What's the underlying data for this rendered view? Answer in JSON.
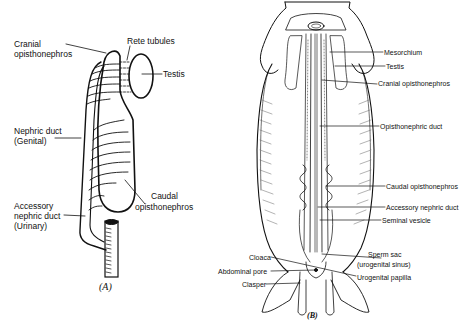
{
  "figure": {
    "panel_a": {
      "tag": "(A)",
      "labels": {
        "cranial_opisthonephros_1": "Cranial",
        "cranial_opisthonephros_2": "opisthonephros",
        "rete_tubules": "Rete tubules",
        "testis": "Testis",
        "nephric_duct_1": "Nephric duct",
        "nephric_duct_2": "(Genital)",
        "caudal_opisthonephros_1": "Caudal",
        "caudal_opisthonephros_2": "opisthonephros",
        "accessory_duct_1": "Accessory",
        "accessory_duct_2": "nephric duct",
        "accessory_duct_3": "(Urinary)"
      }
    },
    "panel_b": {
      "tag": "(B)",
      "labels": {
        "mesorchium": "Mesorchium",
        "testis": "Testis",
        "cranial_opisthonephros": "Cranial opisthonephros",
        "opisthonephric_duct": "Opisthonephric duct",
        "caudal_opisthonephros": "Caudal opisthonephros",
        "accessory_nephric_duct": "Accessory nephric duct",
        "seminal_vesicle": "Seminal vesicle",
        "sperm_sac_1": "Sperm sac",
        "sperm_sac_2": "(urogenital sinus)",
        "urogenital_papilla": "Urogenital papilla",
        "cloaca": "Cloaca",
        "abdominal_pore": "Abdominal pore",
        "clasper": "Clasper"
      }
    }
  }
}
